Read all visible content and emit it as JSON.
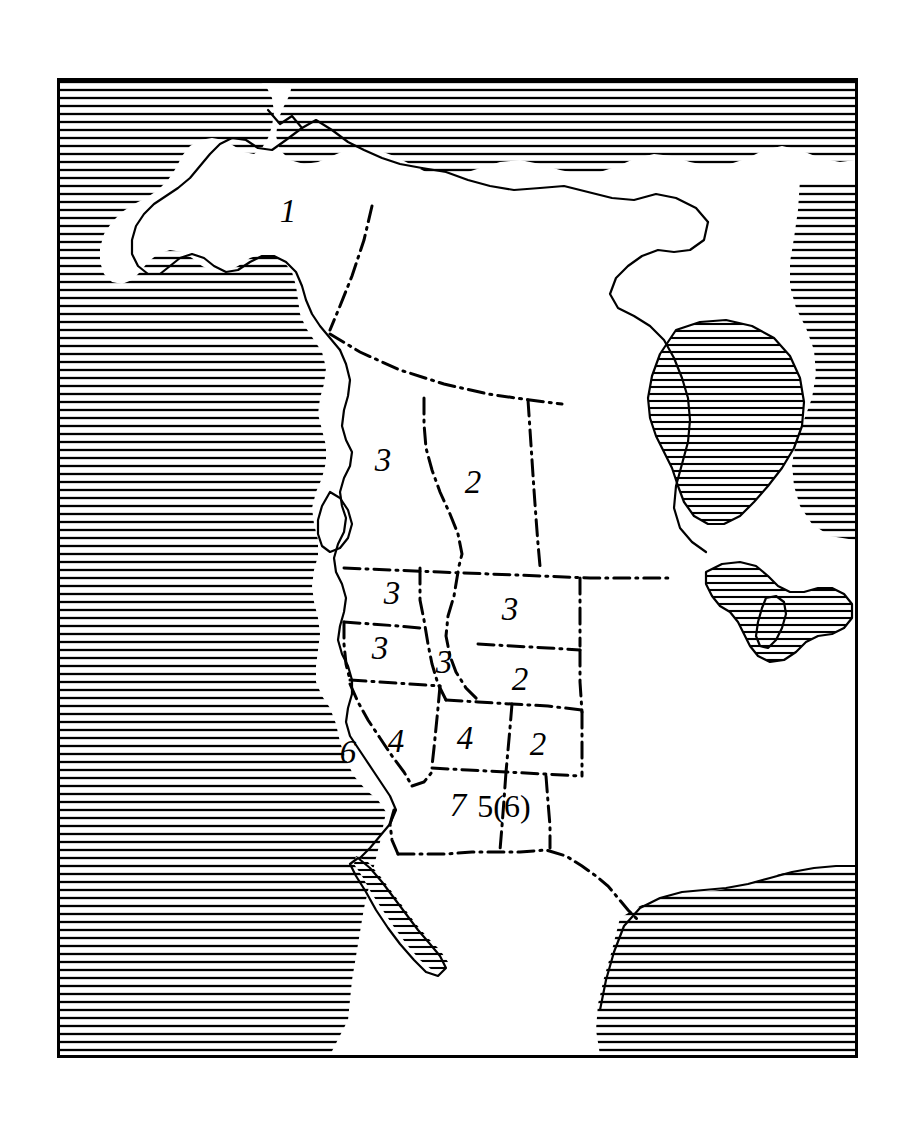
{
  "figure": {
    "kind": "map",
    "region": "North America",
    "style": "line-drawing with hatched water bodies and dash-dot political boundaries",
    "frame": {
      "color": "#000000",
      "border_px": 3
    }
  },
  "map": {
    "background_color": "#ffffff",
    "ink_color": "#000000",
    "water_fill": "horizontal-hatch",
    "boundary_style": "dash-dot",
    "coastline_style": "solid-outline",
    "water_bodies": [
      "Pacific Ocean",
      "Arctic Ocean",
      "Beaufort Sea",
      "Bering Sea",
      "Hudson Bay",
      "Atlantic Ocean",
      "Great Lakes",
      "Gulf of California",
      "Gulf of Mexico"
    ],
    "zones": [
      {
        "id": "alaska",
        "label": "1",
        "name": "Alaska",
        "x": 288,
        "y": 211,
        "size": "big"
      },
      {
        "id": "british-columbia",
        "label": "3",
        "name": "British Columbia",
        "x": 383,
        "y": 460,
        "size": "big"
      },
      {
        "id": "alberta",
        "label": "2",
        "name": "Alberta",
        "x": 473,
        "y": 482,
        "size": "big"
      },
      {
        "id": "washington",
        "label": "3",
        "name": "Washington",
        "x": 392,
        "y": 593,
        "size": "big"
      },
      {
        "id": "montana",
        "label": "3",
        "name": "Montana",
        "x": 510,
        "y": 609,
        "size": "big"
      },
      {
        "id": "oregon",
        "label": "3",
        "name": "Oregon",
        "x": 380,
        "y": 648,
        "size": "big"
      },
      {
        "id": "idaho",
        "label": "3",
        "name": "Idaho",
        "x": 444,
        "y": 662,
        "size": "big"
      },
      {
        "id": "wyoming",
        "label": "2",
        "name": "Wyoming",
        "x": 520,
        "y": 679,
        "size": "big"
      },
      {
        "id": "nevada",
        "label": "4",
        "name": "Nevada",
        "x": 396,
        "y": 741,
        "size": "big"
      },
      {
        "id": "utah",
        "label": "4",
        "name": "Utah",
        "x": 465,
        "y": 738,
        "size": "big"
      },
      {
        "id": "colorado",
        "label": "2",
        "name": "Colorado",
        "x": 538,
        "y": 744,
        "size": "big"
      },
      {
        "id": "california",
        "label": "6",
        "name": "California",
        "x": 348,
        "y": 752,
        "size": "big"
      },
      {
        "id": "arizona",
        "label": "7",
        "name": "Arizona",
        "x": 458,
        "y": 805,
        "size": "big"
      },
      {
        "id": "new-mexico",
        "label": "5(6)",
        "name": "New Mexico",
        "x": 504,
        "y": 806,
        "size": "nm"
      }
    ]
  }
}
